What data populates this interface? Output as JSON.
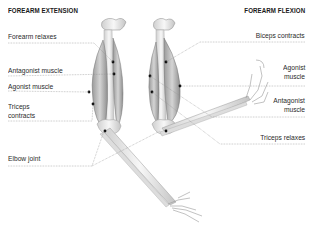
{
  "titles": {
    "left": "FOREARM EXTENSION",
    "right": "FOREARM FLEXION"
  },
  "extension_labels": [
    {
      "id": "forearm-relaxes",
      "text": "Forearm relaxes"
    },
    {
      "id": "antagonist-muscle",
      "text": "Antagonist muscle"
    },
    {
      "id": "agonist-muscle",
      "text": "Agonist muscle"
    },
    {
      "id": "triceps-contracts-1",
      "text": "Triceps"
    },
    {
      "id": "triceps-contracts-2",
      "text": "contracts"
    },
    {
      "id": "elbow-joint",
      "text": "Elbow joint"
    }
  ],
  "flexion_labels": [
    {
      "id": "biceps-contracts",
      "text": "Biceps contracts"
    },
    {
      "id": "agonist-muscle-1",
      "text": "Agonist"
    },
    {
      "id": "agonist-muscle-2",
      "text": "muscle"
    },
    {
      "id": "antagonist-muscle-1",
      "text": "Antagonist"
    },
    {
      "id": "antagonist-muscle-2",
      "text": "muscle"
    },
    {
      "id": "triceps-relaxes",
      "text": "Triceps relaxes"
    }
  ],
  "colors": {
    "text": "#2a2a2a",
    "leader_line": "#8a8a8a",
    "muscle": "#b8b8b8",
    "bone": "#e6e6e6",
    "marker": "#111111"
  }
}
